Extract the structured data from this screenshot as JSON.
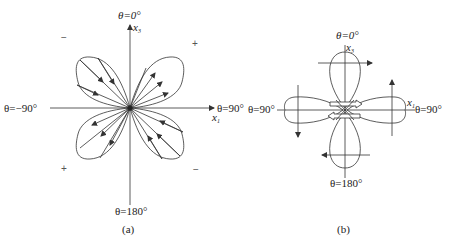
{
  "panel_a": {
    "caption": "(a)",
    "top_label": "θ=0°",
    "bottom_label": "θ=180°",
    "left_label": "θ=−90°",
    "right_label": "θ=90°",
    "axis_vertical": "x",
    "axis_vertical_sub": "3",
    "axis_horizontal": "x",
    "axis_horizontal_sub": "1",
    "signs": {
      "top_left": "−",
      "top_right": "+",
      "bottom_left": "+",
      "bottom_right": "−"
    }
  },
  "panel_b": {
    "caption": "(b)",
    "top_label": "θ=0°",
    "bottom_label": "θ=180°",
    "left_label": "θ=90°",
    "right_label": "θ=90°",
    "axis_vertical": "x",
    "axis_vertical_sub": "3",
    "axis_horizontal": "x",
    "axis_horizontal_sub": "1"
  },
  "colors": {
    "line": "#333333",
    "background": "#ffffff"
  }
}
